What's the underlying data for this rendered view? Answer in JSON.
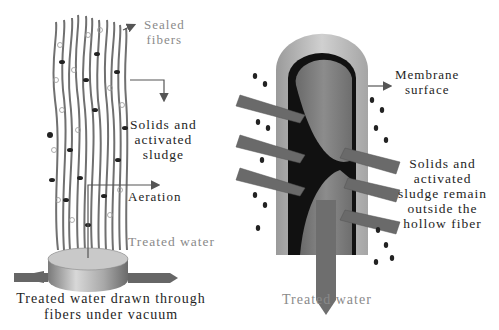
{
  "left_panel": {
    "title": "Treated water drawn through fibers under vacuum",
    "caption_line1": "Treated water drawn through",
    "caption_line2": "fibers under vacuum",
    "labels": {
      "sealed_fibers_1": "Sealed",
      "sealed_fibers_2": "fibers",
      "solids_1": "Solids and",
      "solids_2": "activated",
      "solids_3": "sludge",
      "aeration": "Aeration",
      "treated_water": "Treated water"
    }
  },
  "right_panel": {
    "labels": {
      "membrane_1": "Membrane",
      "membrane_2": "surface",
      "solids_1": "Solids and",
      "solids_2": "activated",
      "solids_3": "sludge remain",
      "solids_4": "outside the",
      "solids_5": "hollow fiber",
      "treated_water": "Treated water"
    }
  },
  "colors": {
    "fiber": "#707070",
    "label_gray": "#8a8a8a",
    "label_dark": "#1e1e1e",
    "membrane_wall": "#b5b5b5",
    "arrow": "#6e6e6e"
  }
}
